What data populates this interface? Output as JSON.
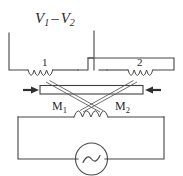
{
  "figure": {
    "type": "circuit-diagram",
    "background_color": "#ffffff",
    "line_color": "#4a4a4a"
  },
  "labels": {
    "output_voltage": {
      "symbol": "V",
      "sub1": "1",
      "minus": "–",
      "symbol2": "V",
      "sub2": "2",
      "full": "V1 – V2"
    },
    "coil_one": "1",
    "coil_two": "2",
    "mutual_one": {
      "symbol": "M",
      "sub": "1",
      "full": "M1"
    },
    "mutual_two": {
      "symbol": "M",
      "sub": "2",
      "full": "M2"
    }
  },
  "components": {
    "secondary_coil_left": {
      "name": "coil-1",
      "turns": 4,
      "label": "1"
    },
    "secondary_coil_right": {
      "name": "coil-2",
      "turns": 4,
      "label": "2"
    },
    "primary_coil": {
      "name": "primary-coil",
      "turns": 4
    },
    "movable_core": {
      "name": "movable-core-bar",
      "arrow_left": "right-pointing",
      "arrow_right": "left-pointing"
    },
    "ac_source": {
      "name": "ac-source",
      "glyph": "sine-wave"
    }
  }
}
